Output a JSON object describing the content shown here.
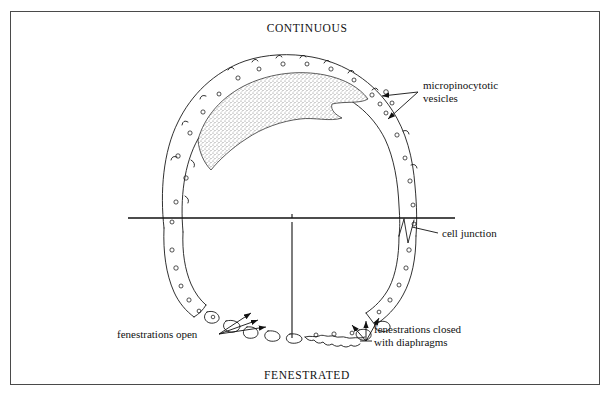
{
  "figure": {
    "title_top": "CONTINUOUS",
    "title_bottom": "FENESTRATED",
    "background_color": "#ffffff",
    "ink_color": "#111111",
    "frame_color": "#4a4a4a"
  },
  "annotations": {
    "micropinocytotic": {
      "line1": "micropinocytotic",
      "line2": "vesicles"
    },
    "cell_junction": {
      "line1": "cell junction"
    },
    "fenestrations_open": {
      "line1": "fenestrations open"
    },
    "fenestrations_closed": {
      "line1": "fenestrations closed",
      "line2": "with diaphragms"
    }
  }
}
